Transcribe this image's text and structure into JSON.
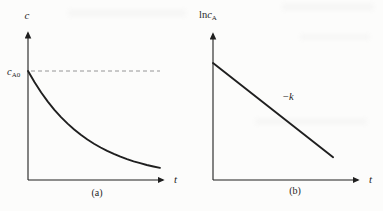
{
  "figure": {
    "background": "#fcfcfb",
    "ink": "#1f1f1f",
    "dash_color": "#8a8a8a"
  },
  "chart_data": [
    {
      "id": "a",
      "type": "line",
      "caption": "(a)",
      "xlabel": "t",
      "ylabel": "c",
      "grid": false,
      "x_range": [
        0,
        1
      ],
      "y_range": [
        0,
        1.3
      ],
      "asymptote": {
        "label_base": "c",
        "label_sub": "A0",
        "value": 1.0,
        "style": "dashed"
      },
      "points": [
        [
          0,
          1.0
        ],
        [
          0.05,
          0.896
        ],
        [
          0.1,
          0.803
        ],
        [
          0.15,
          0.719
        ],
        [
          0.2,
          0.644
        ],
        [
          0.25,
          0.577
        ],
        [
          0.3,
          0.517
        ],
        [
          0.35,
          0.463
        ],
        [
          0.4,
          0.415
        ],
        [
          0.45,
          0.372
        ],
        [
          0.5,
          0.333
        ],
        [
          0.55,
          0.298
        ],
        [
          0.6,
          0.267
        ],
        [
          0.65,
          0.239
        ],
        [
          0.7,
          0.214
        ],
        [
          0.75,
          0.192
        ],
        [
          0.8,
          0.172
        ],
        [
          0.85,
          0.154
        ],
        [
          0.9,
          0.138
        ],
        [
          0.95,
          0.124
        ],
        [
          1.0,
          0.111
        ]
      ]
    },
    {
      "id": "b",
      "type": "line",
      "caption": "(b)",
      "xlabel": "t",
      "ylabel_parts": {
        "ln": "ln",
        "c": "c",
        "sub": "A"
      },
      "grid": false,
      "x_range": [
        0,
        1
      ],
      "y_range": [
        0,
        1
      ],
      "slope_label": {
        "minus": "−",
        "k": "k"
      },
      "points": [
        [
          0,
          0.77
        ],
        [
          0.79,
          0.15
        ]
      ]
    }
  ]
}
